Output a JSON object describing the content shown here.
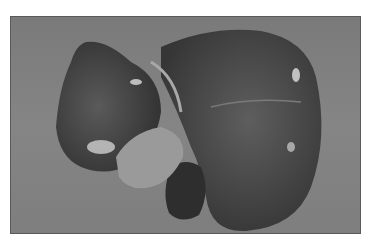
{
  "image": {
    "subject": "liver specimen",
    "description": "Grayscale photograph of an excised liver on a gray background",
    "colors": {
      "background": "#808080",
      "organ_dark": "#3a3a3a",
      "organ_mid": "#555555",
      "highlight": "#d8d8d8",
      "border": "#ffffff"
    }
  }
}
